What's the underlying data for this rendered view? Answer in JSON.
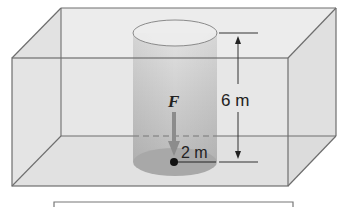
{
  "figure": {
    "type": "physics-diagram",
    "labels": {
      "force": "F",
      "height": "6 m",
      "radius": "2 m"
    },
    "dimensions": {
      "height_m": 6,
      "radius_m": 2
    },
    "colors": {
      "box_edge": "#6e6e6e",
      "box_fill": "#e4e4e4",
      "cylinder_fill": "#b9b9b9",
      "cylinder_bottom": "#a6a6a6",
      "arrow_fill": "#8c8c8c",
      "text": "#222222"
    }
  }
}
